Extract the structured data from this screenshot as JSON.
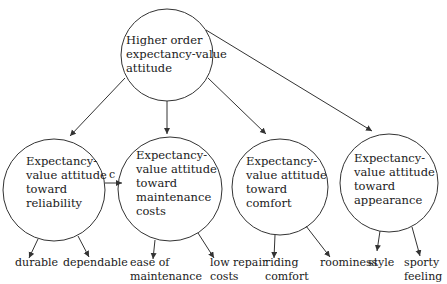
{
  "diagram": {
    "root": {
      "label": "Higher order\nexpectancy-value\nattitude"
    },
    "nodes": [
      {
        "id": "reliability",
        "label": "Expectancy-\nvalue attitude\ntoward\nreliability"
      },
      {
        "id": "maintenance",
        "label": "Expectancy-\nvalue attitude\ntoward\nmaintenance\ncosts"
      },
      {
        "id": "comfort",
        "label": "Expectancy-\nvalue attitude\ntoward\ncomfort"
      },
      {
        "id": "appearance",
        "label": "Expectancy-\nvalue attitude\ntoward\nappearance"
      }
    ],
    "leaves": [
      {
        "parent": "reliability",
        "label": "durable"
      },
      {
        "parent": "reliability",
        "label": "dependable"
      },
      {
        "parent": "maintenance",
        "label": "ease of\nmaintenance"
      },
      {
        "parent": "maintenance",
        "label": "low repair\ncosts"
      },
      {
        "parent": "comfort",
        "label": "riding\ncomfort"
      },
      {
        "parent": "comfort",
        "label": "roominess"
      },
      {
        "parent": "appearance",
        "label": "style"
      },
      {
        "parent": "appearance",
        "label": "sporty\nfeeling"
      }
    ],
    "edge_label_c": "c",
    "colors": {
      "stroke": "#333333",
      "text": "#1a1a1a",
      "background": "#ffffff"
    }
  }
}
